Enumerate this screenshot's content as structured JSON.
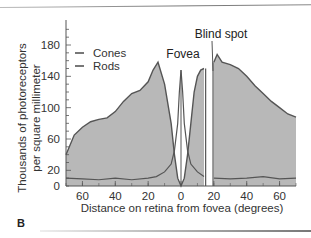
{
  "chart_data": {
    "type": "area",
    "title": "",
    "panel_label": "B",
    "xlabel": "Distance on retina from fovea (degrees)",
    "ylabel": "Thousands of photoreceptors per square millimeter",
    "ylabel_lines": [
      "Thousands of photoreceptors",
      "per square millimeter"
    ],
    "xlim": [
      -70,
      70
    ],
    "ylim": [
      0,
      200
    ],
    "x_ticks": [
      -60,
      -40,
      -20,
      0,
      20,
      40,
      60
    ],
    "x_tick_labels": [
      "60",
      "40",
      "20",
      "0",
      "20",
      "40",
      "60"
    ],
    "y_ticks": [
      0,
      20,
      60,
      100,
      140,
      180
    ],
    "y_tick_labels": [
      "0",
      "20",
      "60",
      "100",
      "140",
      "180"
    ],
    "legend": {
      "position": "upper-left",
      "entries": [
        "Cones",
        "Rods"
      ]
    },
    "annotations": [
      {
        "text": "Fovea",
        "x": 0
      },
      {
        "text": "Blind spot",
        "x": 17
      }
    ],
    "series": [
      {
        "name": "Rods",
        "x": [
          -70,
          -65,
          -60,
          -55,
          -50,
          -45,
          -40,
          -35,
          -30,
          -25,
          -20,
          -17,
          -14,
          -10,
          -6,
          -4,
          -2,
          0,
          2,
          4,
          6,
          8,
          10,
          12,
          14,
          15,
          19,
          20,
          22,
          25,
          30,
          35,
          40,
          45,
          50,
          55,
          60,
          65,
          70
        ],
        "y": [
          40,
          65,
          75,
          82,
          85,
          87,
          95,
          108,
          118,
          122,
          133,
          148,
          158,
          130,
          80,
          40,
          10,
          0,
          10,
          40,
          80,
          120,
          140,
          148,
          150,
          0,
          0,
          158,
          168,
          158,
          155,
          150,
          140,
          128,
          118,
          108,
          100,
          92,
          88
        ]
      },
      {
        "name": "Cones",
        "x": [
          -70,
          -60,
          -50,
          -40,
          -30,
          -20,
          -15,
          -10,
          -6,
          -4,
          -2,
          -1,
          0,
          1,
          2,
          4,
          6,
          10,
          14,
          15,
          19,
          20,
          30,
          40,
          50,
          60,
          70
        ],
        "y": [
          10,
          9,
          8,
          10,
          8,
          10,
          12,
          18,
          28,
          45,
          80,
          120,
          148,
          120,
          80,
          45,
          28,
          18,
          12,
          0,
          0,
          10,
          9,
          10,
          12,
          9,
          10
        ]
      }
    ],
    "grid": false
  },
  "colors": {
    "fill": "#b8b8b8",
    "line": "#555555",
    "axis": "#555555"
  }
}
